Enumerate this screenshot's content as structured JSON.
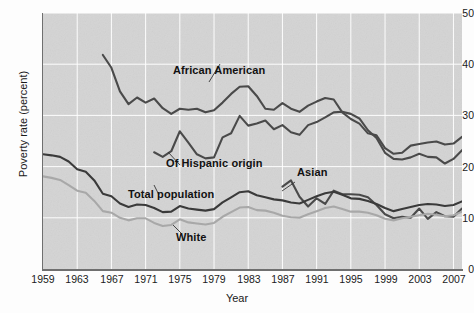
{
  "chart_data": {
    "type": "line",
    "title": "",
    "xlabel": "Year",
    "ylabel": "Poverty rate (percent)",
    "xlim": [
      1959,
      2008
    ],
    "ylim": [
      0,
      50
    ],
    "ytick_values": [
      0,
      10,
      20,
      30,
      40,
      50
    ],
    "ytick_labels": [
      "0",
      "10",
      "20",
      "30",
      "40",
      "50"
    ],
    "xtick_values": [
      1959,
      1963,
      1967,
      1971,
      1975,
      1979,
      1983,
      1987,
      1991,
      1995,
      1999,
      2003,
      2007
    ],
    "xtick_labels": [
      "1959",
      "1963",
      "1967",
      "1971",
      "1975",
      "1979",
      "1983",
      "1987",
      "1991",
      "1995",
      "1999",
      "2003",
      "2007"
    ],
    "grid": true,
    "grid_color": "#ffffff",
    "plot_background": "#d4d4d4",
    "legend_position": "inline-annotations",
    "series": [
      {
        "name": "African American",
        "color": "#4a4a4a",
        "label_text": "African American",
        "x": [
          1966,
          1967,
          1968,
          1969,
          1970,
          1971,
          1972,
          1973,
          1974,
          1975,
          1976,
          1977,
          1978,
          1979,
          1980,
          1981,
          1982,
          1983,
          1984,
          1985,
          1986,
          1987,
          1988,
          1989,
          1990,
          1991,
          1992,
          1993,
          1994,
          1995,
          1996,
          1997,
          1998,
          1999,
          2000,
          2001,
          2002,
          2003,
          2004,
          2005,
          2006,
          2007,
          2008
        ],
        "values": [
          41.8,
          39.3,
          34.7,
          32.2,
          33.5,
          32.5,
          33.3,
          31.4,
          30.3,
          31.3,
          31.1,
          31.3,
          30.6,
          31.0,
          32.5,
          34.2,
          35.6,
          35.7,
          33.8,
          31.3,
          31.1,
          32.4,
          31.3,
          30.7,
          31.9,
          32.7,
          33.4,
          33.1,
          30.6,
          29.3,
          28.4,
          26.5,
          26.1,
          23.6,
          22.5,
          22.7,
          24.1,
          24.4,
          24.7,
          24.9,
          24.3,
          24.5,
          25.8
        ]
      },
      {
        "name": "Of Hispanic origin",
        "color": "#4a4a4a",
        "label_text": "Of Hispanic origin",
        "x": [
          1972,
          1973,
          1974,
          1975,
          1976,
          1977,
          1978,
          1979,
          1980,
          1981,
          1982,
          1983,
          1984,
          1985,
          1986,
          1987,
          1988,
          1989,
          1990,
          1991,
          1992,
          1993,
          1994,
          1995,
          1996,
          1997,
          1998,
          1999,
          2000,
          2001,
          2002,
          2003,
          2004,
          2005,
          2006,
          2007,
          2008
        ],
        "values": [
          22.8,
          21.9,
          23.0,
          26.9,
          24.7,
          22.4,
          21.6,
          21.8,
          25.7,
          26.5,
          29.9,
          28.0,
          28.4,
          29.0,
          27.3,
          28.1,
          26.7,
          26.2,
          28.1,
          28.7,
          29.6,
          30.6,
          30.7,
          30.3,
          29.4,
          27.1,
          25.6,
          22.7,
          21.5,
          21.4,
          21.8,
          22.5,
          21.9,
          21.8,
          20.6,
          21.5,
          23.2
        ]
      },
      {
        "name": "Asian",
        "color": "#4a4a4a",
        "label_text": "Asian",
        "x": [
          1987,
          1988,
          1989,
          1990,
          1991,
          1992,
          1993,
          1994,
          1995,
          1996,
          1997,
          1998,
          1999,
          2000,
          2001,
          2002,
          2003,
          2004,
          2005,
          2006,
          2007,
          2008
        ],
        "values": [
          16.1,
          17.3,
          14.1,
          12.2,
          13.8,
          12.7,
          15.3,
          14.6,
          14.6,
          14.5,
          14.0,
          12.5,
          10.7,
          9.9,
          10.2,
          10.0,
          11.8,
          9.8,
          11.1,
          10.3,
          10.2,
          11.8
        ]
      },
      {
        "name": "Total population",
        "color": "#3a3a3a",
        "label_text": "Total population",
        "x": [
          1959,
          1960,
          1961,
          1962,
          1963,
          1964,
          1965,
          1966,
          1967,
          1968,
          1969,
          1970,
          1971,
          1972,
          1973,
          1974,
          1975,
          1976,
          1977,
          1978,
          1979,
          1980,
          1981,
          1982,
          1983,
          1984,
          1985,
          1986,
          1987,
          1988,
          1989,
          1990,
          1991,
          1992,
          1993,
          1994,
          1995,
          1996,
          1997,
          1998,
          1999,
          2000,
          2001,
          2002,
          2003,
          2004,
          2005,
          2006,
          2007,
          2008
        ],
        "values": [
          22.4,
          22.2,
          21.9,
          21.0,
          19.5,
          19.0,
          17.3,
          14.7,
          14.2,
          12.8,
          12.1,
          12.6,
          12.5,
          11.9,
          11.1,
          11.2,
          12.3,
          11.8,
          11.6,
          11.4,
          11.7,
          13.0,
          14.0,
          15.0,
          15.2,
          14.4,
          14.0,
          13.6,
          13.4,
          13.0,
          12.8,
          13.5,
          14.2,
          14.8,
          15.1,
          14.5,
          13.8,
          13.7,
          13.3,
          12.7,
          11.9,
          11.3,
          11.7,
          12.1,
          12.5,
          12.7,
          12.6,
          12.3,
          12.5,
          13.2
        ]
      },
      {
        "name": "White",
        "color": "#a8a8a8",
        "label_text": "White",
        "x": [
          1959,
          1960,
          1961,
          1962,
          1963,
          1964,
          1965,
          1966,
          1967,
          1968,
          1969,
          1970,
          1971,
          1972,
          1973,
          1974,
          1975,
          1976,
          1977,
          1978,
          1979,
          1980,
          1981,
          1982,
          1983,
          1984,
          1985,
          1986,
          1987,
          1988,
          1989,
          1990,
          1991,
          1992,
          1993,
          1994,
          1995,
          1996,
          1997,
          1998,
          1999,
          2000,
          2001,
          2002,
          2003,
          2004,
          2005,
          2006,
          2007,
          2008
        ],
        "values": [
          18.1,
          17.8,
          17.4,
          16.4,
          15.3,
          14.9,
          13.3,
          11.3,
          11.0,
          10.0,
          9.5,
          9.9,
          9.9,
          9.0,
          8.4,
          8.6,
          9.7,
          9.1,
          8.9,
          8.7,
          9.0,
          10.2,
          11.1,
          12.0,
          12.1,
          11.5,
          11.4,
          11.0,
          10.4,
          10.1,
          10.0,
          10.7,
          11.3,
          11.9,
          12.2,
          11.7,
          11.2,
          11.2,
          11.0,
          10.5,
          9.8,
          9.5,
          9.9,
          10.2,
          10.5,
          10.8,
          10.6,
          10.3,
          10.5,
          11.2
        ]
      }
    ],
    "annotations": [
      {
        "text": "African American",
        "x_px": 173,
        "y_px": 70
      },
      {
        "text": "Of Hispanic origin",
        "x_px": 166,
        "y_px": 163
      },
      {
        "text": "Total population",
        "x_px": 128,
        "y_px": 194
      },
      {
        "text": "White",
        "x_px": 176,
        "y_px": 237
      },
      {
        "text": "Asian",
        "x_px": 297,
        "y_px": 172
      }
    ]
  }
}
